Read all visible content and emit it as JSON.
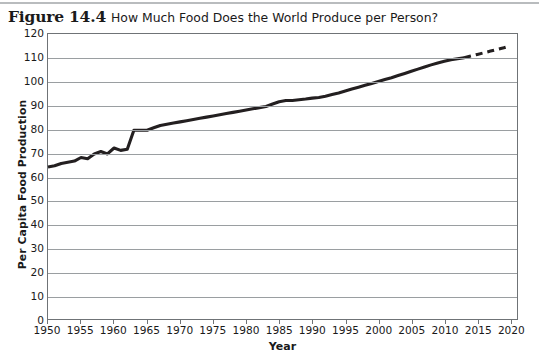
{
  "figure": {
    "number": "Figure 14.4",
    "caption": "How Much Food Does the World Produce per Person?"
  },
  "chart_data": {
    "type": "line",
    "title": "How Much Food Does the World Produce per Person?",
    "xlabel": "Year",
    "ylabel": "Per Capita Food Production",
    "xlim": [
      1950,
      2021
    ],
    "ylim": [
      0,
      120
    ],
    "ytick_step": 10,
    "xtick_step": 5,
    "grid": "horizontal",
    "legend": "none",
    "line_color": "#231f20",
    "series": [
      {
        "name": "Per capita food production (observed)",
        "style": "solid",
        "x": [
          1950,
          1951,
          1952,
          1953,
          1954,
          1955,
          1956,
          1957,
          1958,
          1959,
          1960,
          1961,
          1962,
          1963,
          1964,
          1965,
          1966,
          1967,
          1968,
          1969,
          1970,
          1971,
          1972,
          1973,
          1974,
          1975,
          1976,
          1977,
          1978,
          1979,
          1980,
          1981,
          1982,
          1983,
          1984,
          1985,
          1986,
          1987,
          1988,
          1989,
          1990,
          1991,
          1992,
          1993,
          1994,
          1995,
          1996,
          1997,
          1998,
          1999,
          2000,
          2001,
          2002,
          2003,
          2004,
          2005,
          2006,
          2007,
          2008,
          2009,
          2010,
          2011,
          2012,
          2013
        ],
        "values": [
          64,
          64.5,
          65.5,
          66,
          66.5,
          68,
          67.5,
          69.5,
          70.5,
          69.5,
          72,
          71,
          71.5,
          79.5,
          79.5,
          79.5,
          80.5,
          81.5,
          82,
          82.5,
          83,
          83.5,
          84,
          84.5,
          85,
          85.5,
          86,
          86.5,
          87,
          87.5,
          88,
          88.5,
          89,
          89.5,
          90.5,
          91.5,
          92,
          92,
          92.3,
          92.6,
          93,
          93.3,
          93.8,
          94.5,
          95.2,
          96,
          96.8,
          97.6,
          98.4,
          99.2,
          100,
          100.8,
          101.6,
          102.5,
          103.4,
          104.3,
          105.2,
          106.1,
          107,
          107.8,
          108.5,
          109.2,
          109.6,
          110
        ]
      },
      {
        "name": "Per capita food production (projected)",
        "style": "dashed",
        "x": [
          2013,
          2014,
          2015,
          2016,
          2017,
          2018,
          2019,
          2020
        ],
        "values": [
          110,
          110.7,
          111.4,
          112.1,
          112.8,
          113.5,
          114.2,
          115
        ]
      }
    ],
    "ytick_labels": [
      "0",
      "10",
      "20",
      "30",
      "40",
      "50",
      "60",
      "70",
      "80",
      "90",
      "100",
      "110",
      "120"
    ],
    "xtick_labels": [
      "1950",
      "1955",
      "1960",
      "1965",
      "1970",
      "1975",
      "1980",
      "1985",
      "1990",
      "1995",
      "2000",
      "2005",
      "2010",
      "2015",
      "2020"
    ]
  }
}
